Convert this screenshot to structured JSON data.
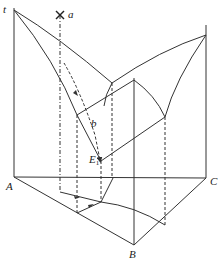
{
  "diagram": {
    "type": "ternary eutectic phase diagram (3D prism with projection)",
    "labels": {
      "temperature_axis": "t",
      "point_a": "a",
      "point_b": "b",
      "eutectic_point": "E",
      "eutectic_subscript": "1",
      "corner_A": "A",
      "corner_B": "B",
      "corner_C": "C"
    },
    "colors": {
      "line": "#333333",
      "background": "#ffffff"
    }
  }
}
